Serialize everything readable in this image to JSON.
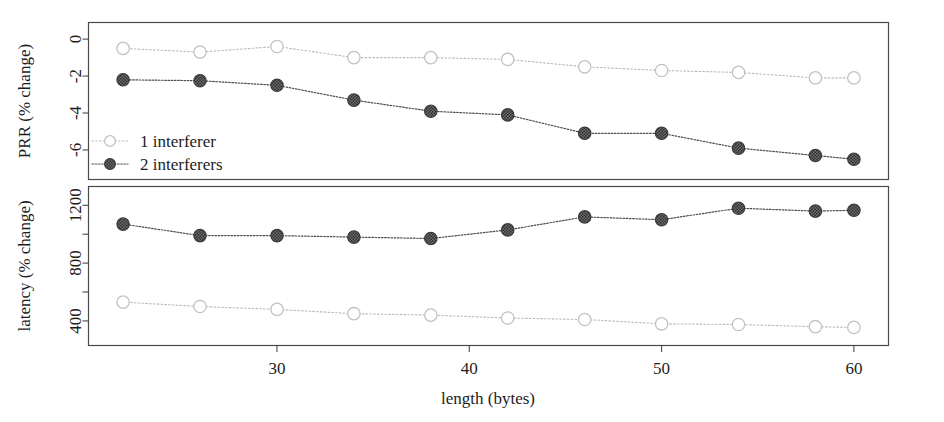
{
  "figure": {
    "name": "prr-latency-vs-length",
    "x_axis": {
      "label": "length (bytes)",
      "ticks": [
        30,
        40,
        50,
        60
      ],
      "tick_labels": [
        "30",
        "40",
        "50",
        "60"
      ],
      "range": [
        20.2,
        61.8
      ]
    },
    "legend": {
      "position": "top-panel-lower-left",
      "entries": [
        {
          "label": "1 interferer",
          "marker": "open-circle",
          "color": "#c2c2c2",
          "style": "dotted"
        },
        {
          "label": "2 interferers",
          "marker": "filled-circle",
          "color": "#4d4d4d",
          "style": "dotted"
        }
      ]
    }
  },
  "chart_data": [
    {
      "type": "line",
      "panel": "top",
      "title": "",
      "xlabel": "length (bytes)",
      "ylabel": "PRR (% change)",
      "x": [
        22,
        26,
        30,
        34,
        38,
        42,
        46,
        50,
        54,
        58,
        60
      ],
      "xlim": [
        20.2,
        61.8
      ],
      "ylim": [
        -7.6,
        0.9
      ],
      "yticks": [
        0,
        -2,
        -4,
        -6
      ],
      "ytick_labels": [
        "0",
        "-2",
        "-4",
        "-6"
      ],
      "grid": false,
      "series": [
        {
          "name": "1 interferer",
          "marker": "open-circle",
          "color": "#c2c2c2",
          "values": [
            -0.5,
            -0.7,
            -0.4,
            -1.0,
            -1.0,
            -1.1,
            -1.5,
            -1.7,
            -1.8,
            -2.1,
            -2.1
          ]
        },
        {
          "name": "2 interferers",
          "marker": "filled-circle",
          "color": "#4d4d4d",
          "values": [
            -2.2,
            -2.25,
            -2.5,
            -3.3,
            -3.9,
            -4.1,
            -5.1,
            -5.1,
            -5.9,
            -6.3,
            -6.5
          ]
        }
      ]
    },
    {
      "type": "line",
      "panel": "bottom",
      "title": "",
      "xlabel": "length (bytes)",
      "ylabel": "latency (% change)",
      "x": [
        22,
        26,
        30,
        34,
        38,
        42,
        46,
        50,
        54,
        58,
        60
      ],
      "xlim": [
        20.2,
        61.8
      ],
      "ylim": [
        230,
        1330
      ],
      "yticks": [
        400,
        800,
        1200
      ],
      "ytick_labels": [
        "400",
        "800",
        "1200"
      ],
      "yticks_minor": [
        600,
        1000
      ],
      "grid": false,
      "series": [
        {
          "name": "1 interferer",
          "marker": "open-circle",
          "color": "#c2c2c2",
          "values": [
            530,
            500,
            480,
            450,
            440,
            420,
            410,
            380,
            375,
            360,
            355
          ]
        },
        {
          "name": "2 interferers",
          "marker": "filled-circle",
          "color": "#4d4d4d",
          "values": [
            1070,
            990,
            990,
            980,
            970,
            1030,
            1120,
            1100,
            1180,
            1160,
            1165
          ]
        }
      ]
    }
  ]
}
